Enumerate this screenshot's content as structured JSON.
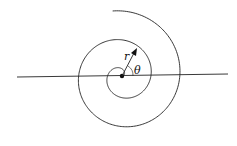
{
  "figure": {
    "type": "polar spiral diagram",
    "labels": {
      "radius": "r",
      "angle": "θ"
    },
    "colors": {
      "stroke": "#222222",
      "background": "#ffffff"
    }
  }
}
